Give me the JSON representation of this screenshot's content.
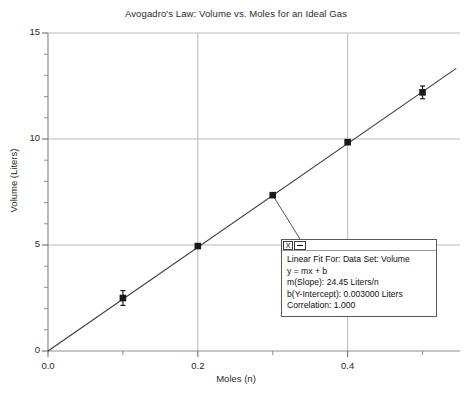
{
  "chart_data": {
    "type": "scatter",
    "title": "Avogadro's Law: Volume vs. Moles for an Ideal Gas",
    "xlabel": "Moles (n)",
    "ylabel": "Volume (Liters)",
    "xlim": [
      0.0,
      0.55
    ],
    "ylim": [
      0,
      15
    ],
    "xticks": [
      0.0,
      0.2,
      0.4
    ],
    "xtick_labels": [
      "0.0",
      "0.2",
      "0.4"
    ],
    "x_minor_ticks": [
      0.1,
      0.3,
      0.5
    ],
    "yticks": [
      0,
      5,
      10,
      15
    ],
    "ytick_labels": [
      "0",
      "5",
      "10",
      "15"
    ],
    "y_minor_ticks": [
      1,
      2,
      3,
      4,
      6,
      7,
      8,
      9,
      11,
      12,
      13,
      14
    ],
    "grid": true,
    "grid_color": "#b9b9b9",
    "legend": "none",
    "marker_color": "#1a1a1a",
    "line_color": "#3a3a3a",
    "series": [
      {
        "name": "Volume",
        "x": [
          0.1,
          0.2,
          0.3,
          0.4,
          0.5
        ],
        "values": [
          2.5,
          4.95,
          7.35,
          9.85,
          12.2
        ],
        "yerr": [
          0.35,
          0.0,
          0.0,
          0.0,
          0.3
        ]
      },
      {
        "name": "Linear Fit",
        "type": "line",
        "x": [
          0.0,
          0.545
        ],
        "values": [
          0.003,
          13.33
        ]
      }
    ]
  },
  "fit_box": {
    "close_label": "X",
    "minimize_label": "",
    "lines": [
      "Linear Fit For: Data Set: Volume",
      "y = mx + b",
      "m(Slope): 24.45 Liters/n",
      "b(Y-Intercept): 0.003000 Liters",
      "Correlation: 1.000"
    ]
  }
}
